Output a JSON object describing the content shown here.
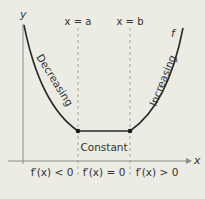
{
  "diagram": {
    "axes": {
      "x_label": "x",
      "y_label": "y"
    },
    "vertical_lines": [
      {
        "label": "x = a"
      },
      {
        "label": "x = b"
      }
    ],
    "curve_label": "f",
    "regions": [
      {
        "label": "Decreasing",
        "condition": "f′(x) < 0"
      },
      {
        "label": "Constant",
        "condition": "f′(x) = 0"
      },
      {
        "label": "Increasing",
        "condition": "f′(x) > 0"
      }
    ],
    "colors": {
      "background": "#ecebe4",
      "curve": "#2a2a2a",
      "axis": "#888888",
      "dashed": "#999999"
    }
  }
}
